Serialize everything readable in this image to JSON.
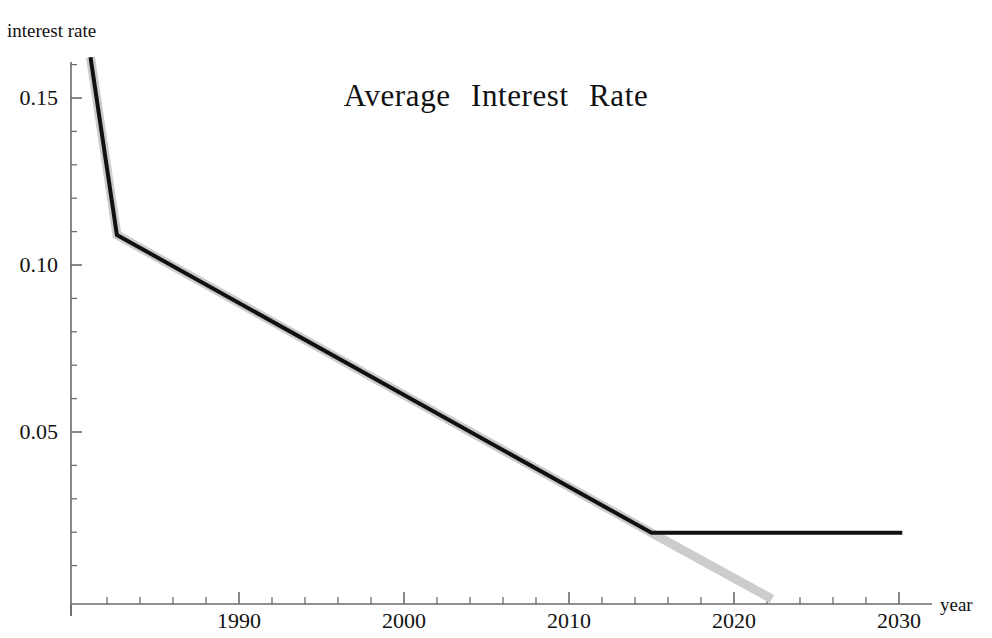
{
  "chart_data": {
    "type": "line",
    "title": "Average  Interest  Rate",
    "xlabel": "year",
    "ylabel": "interest rate",
    "xlim": [
      1981,
      2031.5
    ],
    "ylim": [
      0,
      0.1655
    ],
    "grid": false,
    "legend": "none",
    "x_ticks_major": [
      1990,
      2000,
      2010,
      2020,
      2030
    ],
    "x_tick_labels": [
      "1990",
      "2000",
      "2010",
      "2020",
      "2030"
    ],
    "x_minor_tick_step": 2,
    "y_ticks_major": [
      0.05,
      0.1,
      0.15
    ],
    "y_tick_labels": [
      "0.05",
      "0.10",
      "0.15"
    ],
    "y_minor_tick_step": 0.01,
    "series": [
      {
        "name": "historical-and-capped-projection",
        "color": "#111111",
        "width": 4,
        "points": [
          {
            "x": 1981.0,
            "y": 0.1622
          },
          {
            "x": 1982.6,
            "y": 0.109
          },
          {
            "x": 2015.0,
            "y": 0.0198
          },
          {
            "x": 2030.2,
            "y": 0.0198
          }
        ]
      },
      {
        "name": "uncapped-linear-trend",
        "color": "#cccccc",
        "width": 9,
        "points": [
          {
            "x": 1981.0,
            "y": 0.1622
          },
          {
            "x": 1982.6,
            "y": 0.109
          },
          {
            "x": 2015.0,
            "y": 0.0198
          },
          {
            "x": 2022.3,
            "y": 0.0
          }
        ]
      }
    ]
  },
  "axes": {
    "title": "Average  Interest  Rate",
    "y_axis_label": "interest rate",
    "x_axis_label": "year",
    "y_tick_labels": [
      "0.15",
      "0.10",
      "0.05"
    ],
    "x_tick_labels": [
      "1990",
      "2000",
      "2010",
      "2020",
      "2030"
    ]
  },
  "colors": {
    "line_primary": "#111111",
    "line_secondary": "#cccccc",
    "axis": "#6b6b6b",
    "text": "#111111",
    "background": "#ffffff"
  }
}
